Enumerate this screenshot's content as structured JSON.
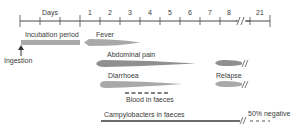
{
  "diagram": {
    "axis": {
      "title": "Days",
      "tick_labels": [
        "1",
        "2",
        "3",
        "4",
        "5",
        "6",
        "7",
        "8",
        "21"
      ],
      "break_symbol": "//"
    },
    "labels": {
      "incubation": "Incubation period",
      "ingestion": "Ingestion",
      "fever": "Fever",
      "abdominal_pain": "Abdominal pain",
      "diarrhoea": "Diarrhoea",
      "relapse": "Relapse",
      "blood": "Blood in faeces",
      "campylobacters": "Campylobacters in faeces",
      "negative": "50% negative"
    },
    "colors": {
      "bar": "#a9a9a9",
      "bar_dark": "#8f8f8f",
      "line": "#4a4a4a"
    }
  }
}
